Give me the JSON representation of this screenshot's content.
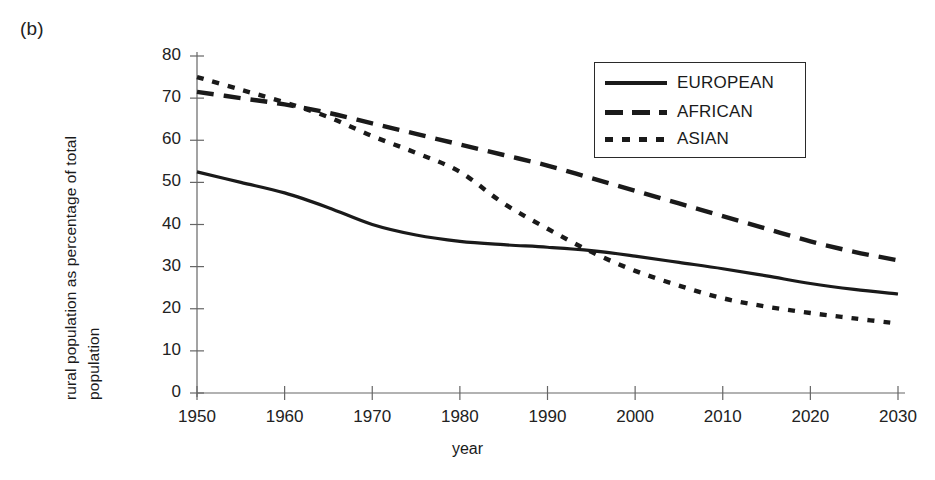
{
  "panel": {
    "label": "(b)"
  },
  "chart_data": {
    "type": "line",
    "title": "",
    "xlabel": "year",
    "ylabel_line1": "rural population as percentage of total",
    "ylabel_line2": "population",
    "xlim": [
      1950,
      2030
    ],
    "ylim": [
      0,
      80
    ],
    "xticks": [
      1950,
      1960,
      1970,
      1980,
      1990,
      2000,
      2010,
      2020,
      2030
    ],
    "yticks": [
      0,
      10,
      20,
      30,
      40,
      50,
      60,
      70,
      80
    ],
    "grid": false,
    "legend_position": "upper-right-inside",
    "x": [
      1950,
      1955,
      1960,
      1965,
      1970,
      1975,
      1980,
      1985,
      1990,
      1995,
      2000,
      2005,
      2010,
      2015,
      2020,
      2025,
      2030
    ],
    "series": [
      {
        "name": "EUROPEAN",
        "style": "solid",
        "color": "#1a1a1a",
        "values": [
          52.5,
          50.0,
          47.5,
          44.0,
          40.0,
          37.5,
          36.0,
          35.2,
          34.6,
          33.8,
          32.5,
          31.0,
          29.5,
          27.8,
          26.0,
          24.6,
          23.5
        ]
      },
      {
        "name": "AFRICAN",
        "style": "dashed",
        "color": "#1a1a1a",
        "values": [
          71.5,
          70.0,
          68.5,
          66.5,
          64.0,
          61.5,
          59.0,
          56.5,
          54.0,
          51.0,
          48.0,
          45.0,
          42.0,
          39.0,
          36.0,
          33.5,
          31.5
        ]
      },
      {
        "name": "ASIAN",
        "style": "dotted",
        "color": "#1a1a1a",
        "values": [
          75.0,
          72.0,
          69.0,
          65.5,
          61.0,
          57.0,
          52.5,
          45.0,
          39.0,
          33.5,
          29.0,
          25.5,
          22.5,
          20.5,
          19.0,
          17.7,
          16.5
        ]
      }
    ]
  },
  "axis": {
    "xtick_labels": [
      "1950",
      "1960",
      "1970",
      "1980",
      "1990",
      "2000",
      "2010",
      "2020",
      "2030"
    ],
    "ytick_labels": [
      "0",
      "10",
      "20",
      "30",
      "40",
      "50",
      "60",
      "70",
      "80"
    ]
  },
  "legend": {
    "entries": [
      {
        "label": "EUROPEAN",
        "style": "solid"
      },
      {
        "label": "AFRICAN",
        "style": "dashed"
      },
      {
        "label": "ASIAN",
        "style": "dotted"
      }
    ]
  },
  "colors": {
    "ink": "#1a1a1a",
    "axis": "#555555",
    "background": "#ffffff"
  }
}
